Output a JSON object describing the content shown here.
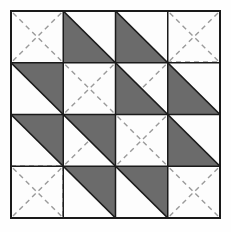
{
  "figure": {
    "type": "quilt-block-diagram",
    "grid": {
      "rows": 4,
      "cols": 4
    },
    "geometry": {
      "x0": 11,
      "y0": 11,
      "x1": 220,
      "y1": 218
    },
    "colors": {
      "background": "#fefefe",
      "shaded": "#6b6b6b",
      "shaded_light": "#7e7e7e",
      "blank": "#fdfdfd",
      "outline": "#1a1a1a",
      "guide": "#9a9a9a"
    },
    "line_styles": {
      "outline": "solid",
      "guide": "dashed",
      "guide_dash": "5,4"
    },
    "legend": {
      "shaded_label": "shaded half-square triangle",
      "blank_label": "plain square with dashed diagonals",
      "guide_label": "dashed construction guideline"
    },
    "cells": [
      {
        "row": 0,
        "col": 0,
        "name": "cell-r1c1",
        "fill": "blank",
        "orientation": "none",
        "guides": "cross"
      },
      {
        "row": 0,
        "col": 1,
        "name": "cell-r1c2",
        "fill": "shaded",
        "orientation": "lower-left",
        "guides": "none"
      },
      {
        "row": 0,
        "col": 2,
        "name": "cell-r1c3",
        "fill": "shaded",
        "orientation": "lower-left",
        "guides": "none"
      },
      {
        "row": 0,
        "col": 3,
        "name": "cell-r1c4",
        "fill": "blank",
        "orientation": "none",
        "guides": "cross"
      },
      {
        "row": 1,
        "col": 0,
        "name": "cell-r2c1",
        "fill": "shaded",
        "orientation": "upper-right",
        "guides": "none"
      },
      {
        "row": 1,
        "col": 1,
        "name": "cell-r2c2",
        "fill": "blank",
        "orientation": "none",
        "guides": "cross"
      },
      {
        "row": 1,
        "col": 2,
        "name": "cell-r2c3",
        "fill": "shaded",
        "orientation": "lower-left",
        "guides": "cross-upper-right"
      },
      {
        "row": 1,
        "col": 3,
        "name": "cell-r2c4",
        "fill": "shaded",
        "orientation": "lower-left",
        "guides": "none"
      },
      {
        "row": 2,
        "col": 0,
        "name": "cell-r3c1",
        "fill": "shaded",
        "orientation": "upper-right",
        "guides": "none"
      },
      {
        "row": 2,
        "col": 1,
        "name": "cell-r3c2",
        "fill": "shaded",
        "orientation": "upper-right",
        "guides": "diag-down"
      },
      {
        "row": 2,
        "col": 2,
        "name": "cell-r3c3",
        "fill": "blank",
        "orientation": "none",
        "guides": "cross"
      },
      {
        "row": 2,
        "col": 3,
        "name": "cell-r3c4",
        "fill": "shaded",
        "orientation": "lower-left",
        "guides": "none"
      },
      {
        "row": 3,
        "col": 0,
        "name": "cell-r4c1",
        "fill": "blank",
        "orientation": "none",
        "guides": "cross"
      },
      {
        "row": 3,
        "col": 1,
        "name": "cell-r4c2",
        "fill": "shaded",
        "orientation": "upper-right",
        "guides": "none"
      },
      {
        "row": 3,
        "col": 2,
        "name": "cell-r4c3",
        "fill": "shaded",
        "orientation": "upper-right",
        "guides": "none"
      },
      {
        "row": 3,
        "col": 3,
        "name": "cell-r4c4",
        "fill": "blank",
        "orientation": "none",
        "guides": "cross"
      }
    ],
    "extra_guides": [
      {
        "name": "guide-top-right-horizontal",
        "x1": 167,
        "y1": 62,
        "x2": 220,
        "y2": 62
      },
      {
        "name": "guide-bottom-left-horizontal",
        "x1": 11,
        "y1": 166,
        "x2": 63,
        "y2": 166
      },
      {
        "name": "guide-bottom-left-vertical",
        "x1": 63,
        "y1": 166,
        "x2": 63,
        "y2": 218
      }
    ]
  }
}
